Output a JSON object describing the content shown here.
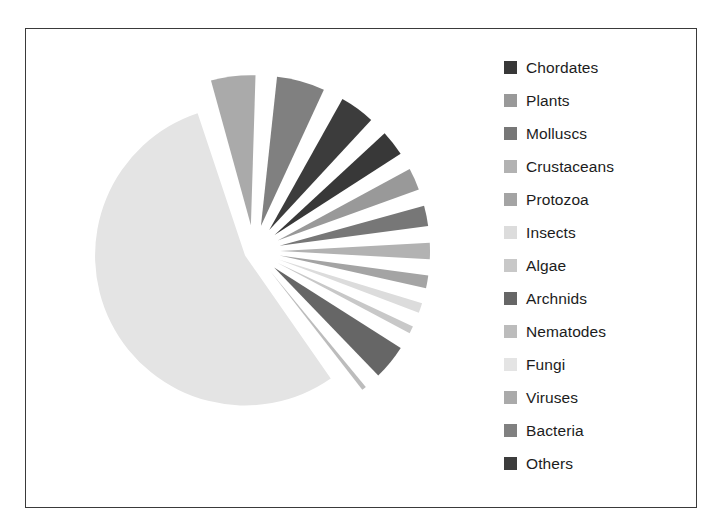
{
  "chart_data": {
    "type": "pie",
    "title": "",
    "subtitle": "",
    "xlabel": "",
    "ylabel": "",
    "exploded": true,
    "legend_position": "right",
    "grid": false,
    "start_angle_deg": 45,
    "direction": "clockwise",
    "categories": [
      "Chordates",
      "Plants",
      "Molluscs",
      "Crustaceans",
      "Protozoa",
      "Insects",
      "Algae",
      "Archnids",
      "Nematodes",
      "Fungi",
      "Viruses",
      "Bacteria",
      "Others"
    ],
    "values": [
      4.0,
      3.6,
      3.4,
      3.0,
      2.6,
      2.3,
      2.0,
      5.0,
      1.7,
      55.0,
      6.0,
      6.4,
      5.0
    ],
    "colors": [
      "#383838",
      "#999999",
      "#777777",
      "#b2b2b2",
      "#a4a4a4",
      "#dcdcdc",
      "#c8c8c8",
      "#666666",
      "#bcbcbc",
      "#e4e4e4",
      "#aaaaaa",
      "#808080",
      "#3c3c3c"
    ],
    "slices": [
      {
        "label": "Chordates",
        "value": 4.0,
        "color": "#383838"
      },
      {
        "label": "Plants",
        "value": 3.6,
        "color": "#999999"
      },
      {
        "label": "Molluscs",
        "value": 3.4,
        "color": "#777777"
      },
      {
        "label": "Crustaceans",
        "value": 3.0,
        "color": "#b2b2b2"
      },
      {
        "label": "Protozoa",
        "value": 2.6,
        "color": "#a4a4a4"
      },
      {
        "label": "Insects",
        "value": 2.3,
        "color": "#dcdcdc"
      },
      {
        "label": "Algae",
        "value": 2.0,
        "color": "#c8c8c8"
      },
      {
        "label": "Archnids",
        "value": 5.0,
        "color": "#666666"
      },
      {
        "label": "Nematodes",
        "value": 1.7,
        "color": "#bcbcbc"
      },
      {
        "label": "Fungi",
        "value": 55.0,
        "color": "#e4e4e4"
      },
      {
        "label": "Viruses",
        "value": 6.0,
        "color": "#aaaaaa"
      },
      {
        "label": "Bacteria",
        "value": 6.4,
        "color": "#808080"
      },
      {
        "label": "Others",
        "value": 5.0,
        "color": "#3c3c3c"
      }
    ]
  },
  "legend": {
    "items": [
      {
        "label": "Chordates",
        "color": "#383838"
      },
      {
        "label": "Plants",
        "color": "#999999"
      },
      {
        "label": "Molluscs",
        "color": "#777777"
      },
      {
        "label": "Crustaceans",
        "color": "#b2b2b2"
      },
      {
        "label": "Protozoa",
        "color": "#a4a4a4"
      },
      {
        "label": "Insects",
        "color": "#dcdcdc"
      },
      {
        "label": "Algae",
        "color": "#c8c8c8"
      },
      {
        "label": "Archnids",
        "color": "#666666"
      },
      {
        "label": "Nematodes",
        "color": "#bcbcbc"
      },
      {
        "label": "Fungi",
        "color": "#e4e4e4"
      },
      {
        "label": "Viruses",
        "color": "#aaaaaa"
      },
      {
        "label": "Bacteria",
        "color": "#808080"
      },
      {
        "label": "Others",
        "color": "#3c3c3c"
      }
    ]
  },
  "frame": {
    "border_color": "#3a3a3a",
    "background": "#ffffff"
  }
}
